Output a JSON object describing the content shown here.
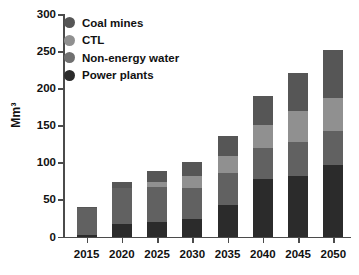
{
  "chart_data": {
    "type": "bar",
    "stacked": true,
    "title": "",
    "xlabel": "",
    "ylabel": "Mm³",
    "ylim": [
      0,
      300
    ],
    "yticks": [
      0,
      50,
      100,
      150,
      200,
      250,
      300
    ],
    "ytick_labels": [
      "0",
      "50",
      "100",
      "150",
      "200",
      "250",
      "300"
    ],
    "grid": false,
    "legend_position": "top-left",
    "categories": [
      "2015",
      "2020",
      "2025",
      "2030",
      "2035",
      "2040",
      "2045",
      "2050"
    ],
    "series": [
      {
        "name": "Power plants",
        "color": "#2b2b2b",
        "values": [
          2,
          17,
          20,
          24,
          42,
          77,
          81,
          97
        ]
      },
      {
        "name": "Non-energy water",
        "color": "#616161",
        "values": [
          37,
          49,
          47,
          42,
          44,
          43,
          46,
          45
        ]
      },
      {
        "name": "CTL",
        "color": "#909090",
        "values": [
          0,
          0,
          7,
          16,
          23,
          31,
          42,
          45
        ]
      },
      {
        "name": "Coal mines",
        "color": "#565656",
        "values": [
          1,
          7,
          14,
          19,
          26,
          38,
          52,
          64
        ]
      }
    ],
    "totals": [
      40,
      73,
      88,
      101,
      135,
      189,
      221,
      251
    ]
  },
  "legend": {
    "items": [
      {
        "label": "Coal mines",
        "color": "#565656"
      },
      {
        "label": "CTL",
        "color": "#909090"
      },
      {
        "label": "Non-energy water",
        "color": "#707070"
      },
      {
        "label": "Power plants",
        "color": "#2b2b2b"
      }
    ]
  }
}
